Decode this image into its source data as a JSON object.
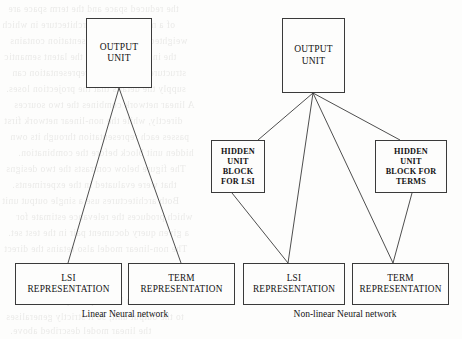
{
  "figure": {
    "background_color": "#fdfdfc",
    "line_color": "#3a3a3a"
  },
  "networks": {
    "linear": {
      "caption": "Linear Neural network",
      "output": {
        "line1": "OUTPUT",
        "line2": "UNIT"
      },
      "inputs": [
        {
          "line1": "LSI",
          "line2": "REPRESENTATION"
        },
        {
          "line1": "TERM",
          "line2": "REPRESENTATION"
        }
      ]
    },
    "nonlinear": {
      "caption": "Non-linear Neural network",
      "output": {
        "line1": "OUTPUT",
        "line2": "UNIT"
      },
      "hidden": [
        {
          "line1": "HIDDEN",
          "line2": "UNIT",
          "line3": "BLOCK",
          "line4": "FOR LSI"
        },
        {
          "line1": "HIDDEN",
          "line2": "UNIT",
          "line3": "BLOCK FOR",
          "line4": "TERMS"
        }
      ],
      "inputs": [
        {
          "line1": "LSI",
          "line2": "REPRESENTATION"
        },
        {
          "line1": "TERM",
          "line2": "REPRESENTATION"
        }
      ]
    }
  },
  "background_text": [
    "the reduced space and the term space are",
    "of a neural network architecture in which",
    "weighted. The LSI representation contains",
    "the information about the latent semantic",
    "structure, and the term representation can",
    "supply the details that the projection loses.",
    "A linear network combines the two sources",
    "directly, while the non-linear network first",
    "passes each representation through its own",
    "hidden unit block before the combination.",
    "The figure below contrasts the two designs",
    "that were evaluated in the experiments.",
    "Both architectures use a single output unit",
    "which produces the relevance estimate for",
    "a given query document pair in the test set.",
    "The non-linear model also retains the direct",
    "connections from both input representations",
    "to the output unit, so it strictly generalises",
    "the linear model described above."
  ]
}
